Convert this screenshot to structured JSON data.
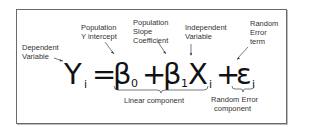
{
  "diagram": {
    "equation": {
      "Y": "Y",
      "Y_sub": "i",
      "equals": "=",
      "beta0": "β",
      "beta0_sub": "0",
      "plus1": "+",
      "beta1": "β",
      "beta1_sub": "1",
      "X": "X",
      "X_sub": "i",
      "plus2": "+",
      "epsilon": "ε",
      "epsilon_sub": "i"
    },
    "annotations": {
      "dependent_variable": [
        "Dependent",
        "Variable"
      ],
      "population_y_intercept": [
        "Population",
        "Y  intercept"
      ],
      "population_slope_coefficient": [
        "Population",
        "Slope",
        "Coefficient"
      ],
      "independent_variable": [
        "Independent",
        "Variable"
      ],
      "random_error_term": [
        "Random",
        "Error",
        "term"
      ]
    },
    "braces": {
      "linear_component": "Linear component",
      "random_error_component": [
        "Random Error",
        "component"
      ]
    },
    "colors": {
      "border": "#6a6a6a",
      "text": "#222222",
      "background": "#ffffff"
    }
  }
}
